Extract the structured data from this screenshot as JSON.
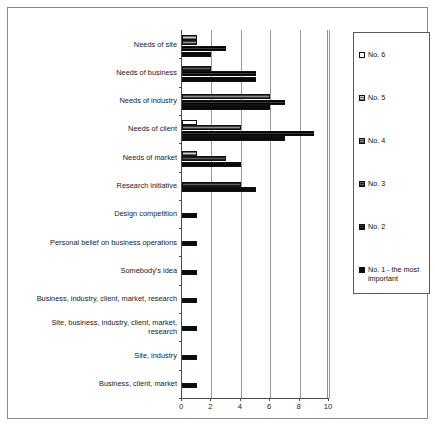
{
  "chart_data": {
    "type": "bar",
    "orientation": "horizontal",
    "title": "",
    "xlabel": "",
    "ylabel": "",
    "xlim": [
      0,
      10
    ],
    "xticks": [
      0,
      2,
      4,
      6,
      8,
      10
    ],
    "grid": true,
    "legend_position": "right",
    "categories": [
      "Needs of site",
      "Needs of business",
      "Needs of industry",
      "Needs of client",
      "Needs of market",
      "Research initiative",
      "Design competition",
      "Personal belief on business operations",
      "Somebody's idea",
      "Business, industry, client, market, research",
      "Site, business, industry, client, market, research",
      "Site, industry",
      "Business, client, market"
    ],
    "series": [
      {
        "name": "No. 6",
        "color": "#ffffff",
        "values": [
          0,
          0,
          0,
          1,
          0,
          0,
          0,
          0,
          0,
          0,
          0,
          0,
          0
        ]
      },
      {
        "name": "No. 5",
        "color": "#a8a8a8",
        "values": [
          1,
          0,
          0,
          0,
          1,
          0,
          0,
          0,
          0,
          0,
          0,
          0,
          0
        ]
      },
      {
        "name": "No. 4",
        "color": "#6e6e6e",
        "values": [
          1,
          0,
          6,
          4,
          0,
          0,
          0,
          0,
          0,
          0,
          0,
          0,
          0
        ]
      },
      {
        "name": "No. 3",
        "color": "#3c3c3c",
        "values": [
          0,
          2,
          0,
          0,
          3,
          4,
          0,
          0,
          0,
          0,
          0,
          0,
          0
        ]
      },
      {
        "name": "No. 2",
        "color": "#1c1c1c",
        "values": [
          3,
          5,
          7,
          9,
          0,
          0,
          0,
          0,
          0,
          0,
          0,
          0,
          0
        ]
      },
      {
        "name": "No. 1 - the most important",
        "color": "#0b0b0b",
        "values": [
          2,
          5,
          6,
          7,
          4,
          5,
          1,
          1,
          1,
          1,
          1,
          1,
          1
        ]
      }
    ]
  },
  "legend": {
    "items": [
      {
        "label": "No. 6",
        "swatch": "legend-swatch-no6"
      },
      {
        "label": "No. 5",
        "swatch": "legend-swatch-no5"
      },
      {
        "label": "No. 4",
        "swatch": "legend-swatch-no4"
      },
      {
        "label": "No. 3",
        "swatch": "legend-swatch-no3"
      },
      {
        "label": "No. 2",
        "swatch": "legend-swatch-no2"
      },
      {
        "label": "No. 1 - the most important",
        "swatch": "legend-swatch-no1"
      }
    ]
  },
  "axis": {
    "x_tick_labels": [
      "0",
      "2",
      "4",
      "6",
      "8",
      "10"
    ]
  }
}
